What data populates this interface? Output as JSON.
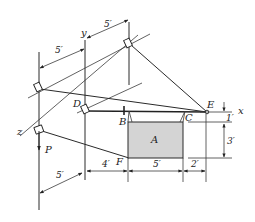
{
  "figure": {
    "type": "3D statics diagram - suspended plate supported by cables",
    "labels": {
      "y_axis": "y",
      "x_axis": "x",
      "z_axis": "z",
      "point_D": "D",
      "point_B": "B",
      "point_C": "C",
      "point_E": "E",
      "point_F": "F",
      "plate": "A",
      "load": "P"
    },
    "dimensions": {
      "top_left_5": "5′",
      "top_right_5": "5′",
      "bottom_left_5": "5′",
      "bottom_4": "4′",
      "bottom_5": "5′",
      "bottom_2": "2′",
      "right_1": "1′",
      "right_3": "3′"
    },
    "colors": {
      "plate_fill": "#d4d4d4",
      "line": "#2a2a2a"
    }
  }
}
